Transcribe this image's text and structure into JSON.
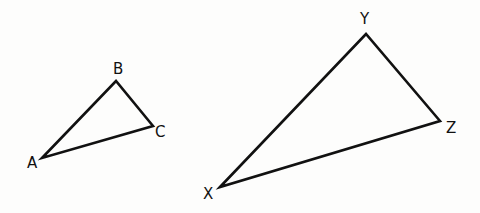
{
  "diagram": {
    "title": "",
    "stroke_color": "#111111",
    "triangles": [
      {
        "name": "ABC",
        "vertices": [
          {
            "label": "A",
            "x": 42,
            "y": 158,
            "lx": 27,
            "ly": 168
          },
          {
            "label": "B",
            "x": 116,
            "y": 81,
            "lx": 113,
            "ly": 74
          },
          {
            "label": "C",
            "x": 153,
            "y": 126,
            "lx": 155,
            "ly": 137
          }
        ]
      },
      {
        "name": "XYZ",
        "vertices": [
          {
            "label": "X",
            "x": 220,
            "y": 187,
            "lx": 203,
            "ly": 199
          },
          {
            "label": "Y",
            "x": 366,
            "y": 34,
            "lx": 360,
            "ly": 24
          },
          {
            "label": "Z",
            "x": 440,
            "y": 121,
            "lx": 446,
            "ly": 133
          }
        ]
      }
    ]
  }
}
